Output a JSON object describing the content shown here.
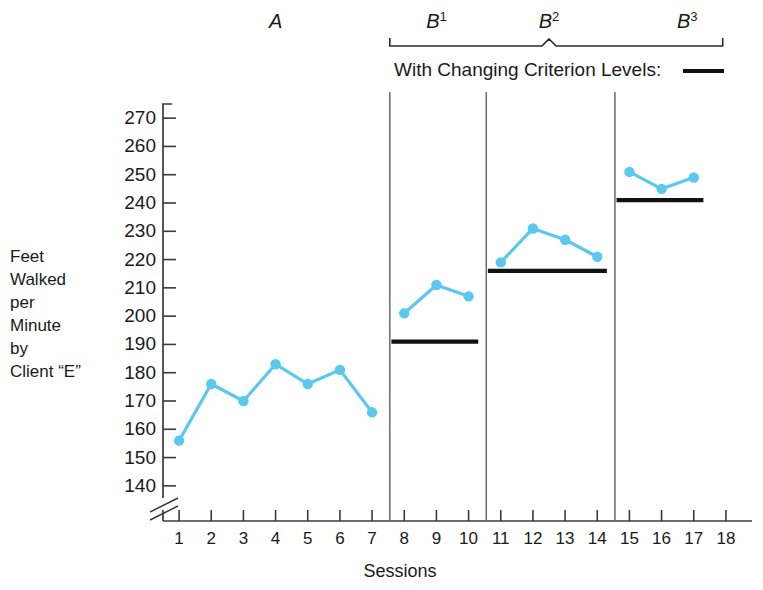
{
  "chart_data": {
    "type": "line",
    "title": "",
    "xlabel": "Sessions",
    "ylabel": "Feet Walked per Minute by Client \"E\"",
    "ylabel_lines": [
      "Feet",
      "Walked",
      "per",
      "Minute",
      "by",
      "Client “E”"
    ],
    "xlim": [
      0.5,
      18.5
    ],
    "ylim": [
      135,
      275
    ],
    "yticks": [
      140,
      150,
      160,
      170,
      180,
      190,
      200,
      210,
      220,
      230,
      240,
      250,
      260,
      270
    ],
    "xticks": [
      1,
      2,
      3,
      4,
      5,
      6,
      7,
      8,
      9,
      10,
      11,
      12,
      13,
      14,
      15,
      16,
      17,
      18
    ],
    "y_axis_break": true,
    "y_axis_break_below": 140,
    "grid": false,
    "legend": false,
    "series_color": "#5BC8F0",
    "criterion_color": "#111111",
    "series": [
      {
        "name": "Feet Walked per Minute",
        "x": [
          1,
          2,
          3,
          4,
          5,
          6,
          7,
          8,
          9,
          10,
          11,
          12,
          13,
          14,
          15,
          16,
          17
        ],
        "values": [
          156,
          176,
          170,
          183,
          176,
          181,
          166,
          201,
          211,
          207,
          219,
          231,
          227,
          221,
          251,
          245,
          249
        ],
        "segments": [
          {
            "phase": "A",
            "x": [
              1,
              2,
              3,
              4,
              5,
              6,
              7
            ],
            "values": [
              156,
              176,
              170,
              183,
              176,
              181,
              166
            ]
          },
          {
            "phase": "B1",
            "x": [
              8,
              9,
              10
            ],
            "values": [
              201,
              211,
              207
            ]
          },
          {
            "phase": "B2",
            "x": [
              11,
              12,
              13,
              14
            ],
            "values": [
              219,
              231,
              227,
              221
            ]
          },
          {
            "phase": "B3",
            "x": [
              15,
              16,
              17
            ],
            "values": [
              251,
              245,
              249
            ]
          }
        ]
      }
    ],
    "criterion_levels": [
      {
        "phase": "B1",
        "value": 191,
        "x_start": 7.6,
        "x_end": 10.3
      },
      {
        "phase": "B2",
        "value": 216,
        "x_start": 10.6,
        "x_end": 14.3
      },
      {
        "phase": "B3",
        "value": 241,
        "x_start": 14.6,
        "x_end": 17.3
      }
    ],
    "phase_dividers": [
      7.55,
      10.55,
      14.55
    ],
    "phases": [
      {
        "label": "A",
        "superscript": "",
        "x_center": 4.0
      },
      {
        "label": "B",
        "superscript": "1",
        "x_center": 9.0
      },
      {
        "label": "B",
        "superscript": "2",
        "x_center": 12.5
      },
      {
        "label": "B",
        "superscript": "3",
        "x_center": 16.8
      }
    ],
    "annotations": [
      {
        "name": "criterion-note",
        "text": "With Changing Criterion Levels:",
        "has_line_sample": true
      }
    ],
    "treatment_bracket": {
      "x_start": 7.55,
      "x_end": 17.9,
      "notch_x": 12.5
    }
  }
}
